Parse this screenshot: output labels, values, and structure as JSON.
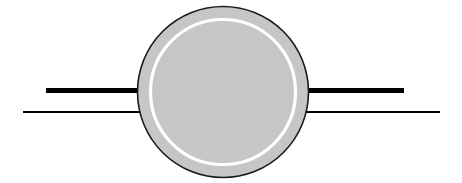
{
  "canvas": {
    "width": 462,
    "height": 183,
    "background_color": "#FFFFFF"
  },
  "diagram": {
    "title": "",
    "type": "schematic-annulus-with-leads",
    "colors": {
      "disc_fill": "#C6C6C6",
      "disc_outline": "#1A1A1A",
      "inner_ring": "#FFFFFF",
      "lead_line": "#000000",
      "background": "#FFFFFF"
    },
    "disc": {
      "label": "disc",
      "center_x": 223,
      "center_y": 92,
      "outer_radius": 85.5,
      "outline_width": 1.6,
      "fill": "#C6C6C6",
      "stroke": "#1A1A1A"
    },
    "inner_ring": {
      "label": "inner-ring",
      "center_x": 223,
      "center_y": 92,
      "radius": 72.5,
      "stroke": "#FFFFFF",
      "stroke_width": 3.2
    },
    "leads": [
      {
        "label": "upper-left-lead",
        "x1": 46,
        "y1": 90.5,
        "x2": 142,
        "y2": 90.5,
        "stroke": "#000000",
        "stroke_width": 5
      },
      {
        "label": "upper-right-lead",
        "x1": 305,
        "y1": 90.5,
        "x2": 404,
        "y2": 90.5,
        "stroke": "#000000",
        "stroke_width": 5
      },
      {
        "label": "lower-left-lead",
        "x1": 23,
        "y1": 112,
        "x2": 148,
        "y2": 112,
        "stroke": "#000000",
        "stroke_width": 2
      },
      {
        "label": "lower-right-lead",
        "x1": 299,
        "y1": 112,
        "x2": 440,
        "y2": 112,
        "stroke": "#000000",
        "stroke_width": 2
      }
    ]
  }
}
